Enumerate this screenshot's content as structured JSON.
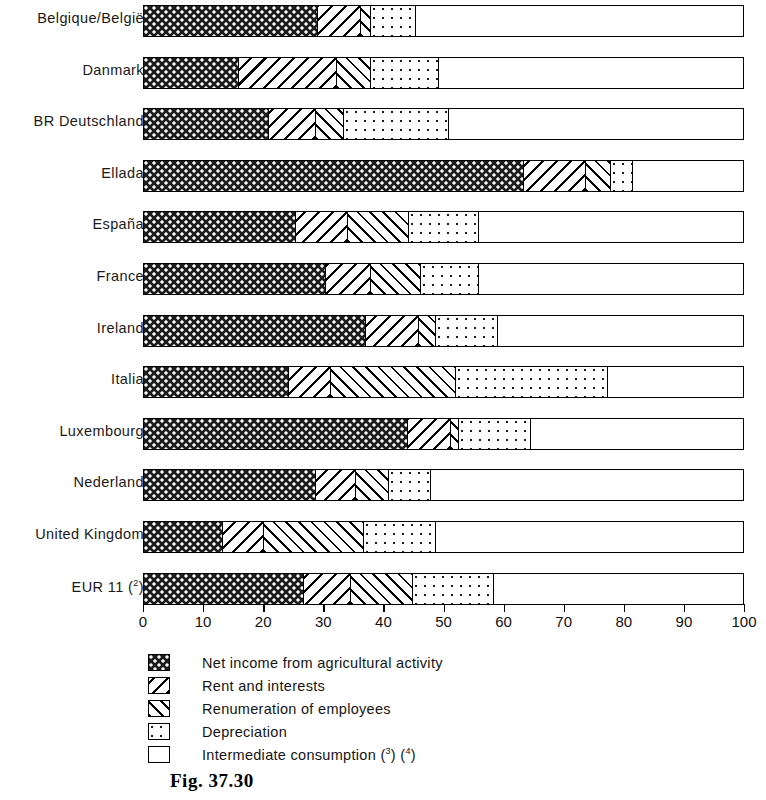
{
  "figure": {
    "caption": "Fig. 37.30"
  },
  "chart_data": {
    "type": "bar",
    "orientation": "horizontal",
    "stacked": true,
    "title": "",
    "xlabel": "",
    "ylabel": "",
    "xlim": [
      0,
      100
    ],
    "xticks": [
      0,
      10,
      20,
      30,
      40,
      50,
      60,
      70,
      80,
      90,
      100
    ],
    "xtick_labels": [
      "0",
      "10",
      "20",
      "30",
      "40",
      "50",
      "60",
      "70",
      "80",
      "90",
      "100"
    ],
    "grid": false,
    "legend_position": "below",
    "categories": [
      "Belgique/België",
      "Danmark",
      "BR Deutschland",
      "Ellada",
      "España",
      "France",
      "Ireland",
      "Italia",
      "Luxembourg",
      "Nederland",
      "United Kingdom",
      "EUR 11 (2)"
    ],
    "series": [
      {
        "name": "Net income from agricultural activity",
        "pattern": "checkerboard",
        "values": [
          29.0,
          15.8,
          20.8,
          63.2,
          25.3,
          30.3,
          36.9,
          24.1,
          43.9,
          28.6,
          13.1,
          26.6
        ]
      },
      {
        "name": "Rent and interests",
        "pattern": "backslash-hatch",
        "values": [
          7.1,
          16.3,
          7.8,
          10.3,
          8.6,
          7.5,
          8.9,
          7.0,
          7.2,
          6.7,
          6.9,
          7.8
        ]
      },
      {
        "name": "Renumeration of employees",
        "pattern": "slash-hatch",
        "values": [
          1.7,
          5.7,
          4.7,
          4.2,
          10.2,
          8.3,
          2.8,
          20.8,
          1.3,
          5.5,
          16.6,
          10.4
        ]
      },
      {
        "name": "Depreciation",
        "pattern": "dotted",
        "values": [
          7.5,
          11.3,
          17.4,
          3.7,
          11.6,
          9.6,
          10.3,
          25.3,
          12.0,
          7.0,
          12.0,
          13.4
        ]
      },
      {
        "name": "Intermediate consumption (3) (4)",
        "pattern": "blank",
        "values": [
          54.7,
          50.9,
          49.3,
          18.6,
          44.3,
          44.3,
          41.1,
          22.8,
          35.6,
          52.2,
          51.4,
          41.8
        ]
      }
    ]
  },
  "legend": {
    "items": [
      {
        "label": "Net income from agricultural activity",
        "sup": ""
      },
      {
        "label": "Rent and interests",
        "sup": ""
      },
      {
        "label": "Renumeration of employees",
        "sup": ""
      },
      {
        "label": "Depreciation",
        "sup": ""
      },
      {
        "label": "Intermediate consumption (3) (4)",
        "sup": ""
      }
    ]
  }
}
